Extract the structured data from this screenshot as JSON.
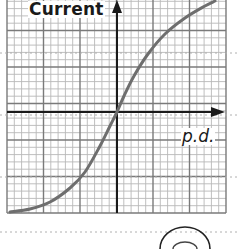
{
  "diagram": {
    "y_axis_label": "Current",
    "x_axis_label": "p.d.",
    "colors": {
      "grid_minor": "#b8b8b8",
      "grid_major": "#7a7a7a",
      "axes": "#1a1a1a",
      "curve": "#6e6e6e",
      "dotted_rule": "#b0b0b0"
    },
    "grid": {
      "left": 7,
      "right": 226,
      "top": 0,
      "bottom": 213,
      "minor_spacing": 7.3,
      "major_every": 5
    },
    "origin": {
      "x": 117,
      "y": 112
    }
  },
  "chart_data": {
    "type": "line",
    "title": "",
    "xlabel": "p.d.",
    "ylabel": "Current",
    "grid": true,
    "series": [
      {
        "name": "I-V curve",
        "points_px": [
          [
            10,
            212
          ],
          [
            30,
            209
          ],
          [
            50,
            202
          ],
          [
            70,
            188
          ],
          [
            85,
            172
          ],
          [
            100,
            146
          ],
          [
            110,
            126
          ],
          [
            117,
            112
          ],
          [
            124,
            96
          ],
          [
            134,
            76
          ],
          [
            148,
            54
          ],
          [
            165,
            34
          ],
          [
            185,
            18
          ],
          [
            205,
            6
          ],
          [
            215,
            1
          ]
        ]
      }
    ]
  }
}
